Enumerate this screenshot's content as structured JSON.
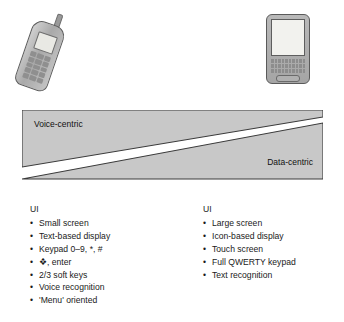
{
  "figure": {
    "devices": {
      "left": {
        "name": "feature-phone",
        "icon": "mobile-phone-icon",
        "parts": [
          "antenna",
          "screen",
          "keypad"
        ]
      },
      "right": {
        "name": "pda-device",
        "icon": "pda-icon",
        "parts": [
          "screen",
          "qwerty-keypad",
          "space-bar"
        ]
      }
    },
    "spectrum": {
      "left_label": "Voice-centric",
      "right_label": "Data-centric",
      "band_color": "#c8c8c8",
      "divider_color": "#ffffff",
      "outline_color": "#3a3a3a"
    },
    "columns": [
      {
        "heading": "UI",
        "items": [
          "Small screen",
          "Text-based display",
          "Keypad 0–9, *, #",
          "❖, enter",
          "2/3 soft keys",
          "Voice recognition",
          "'Menu' oriented"
        ]
      },
      {
        "heading": "UI",
        "items": [
          "Large screen",
          "Icon-based display",
          "Touch screen",
          "Full QWERTY keypad",
          "Text recognition"
        ]
      }
    ]
  }
}
